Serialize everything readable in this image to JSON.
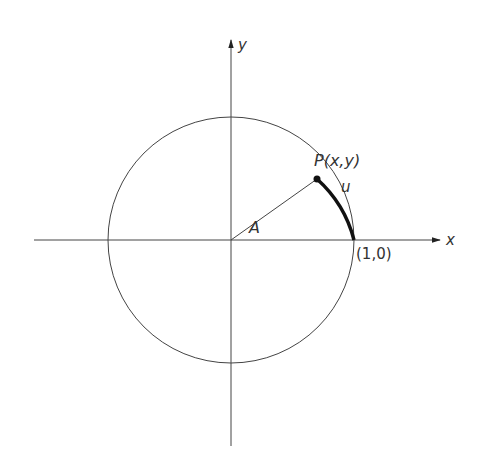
{
  "labels": {
    "x_axis": "x",
    "y_axis": "y",
    "point": "P(x,y)",
    "arc": "u",
    "angle": "A",
    "unit_point": "(1,0)"
  },
  "colors": {
    "stroke": "#333333",
    "arc": "#111111"
  }
}
